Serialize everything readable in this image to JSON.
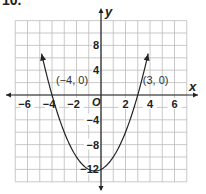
{
  "problem_label": "10.",
  "chart_data": {
    "type": "line",
    "title": "",
    "function": "y = x^2 + x - 12",
    "xlabel": "x",
    "ylabel": "y",
    "origin_label": "O",
    "xlim": [
      -7,
      7
    ],
    "ylim": [
      -14,
      12
    ],
    "x_ticks": [
      -6,
      -4,
      -2,
      2,
      4,
      6
    ],
    "y_ticks": [
      8,
      4,
      -4,
      -8,
      -12
    ],
    "x_grid_step": 1,
    "y_grid_step": 2,
    "grid": true,
    "annotations": [
      {
        "label": "(−4, 0)",
        "x": -4,
        "y": 0
      },
      {
        "label": "(3, 0)",
        "x": 3,
        "y": 0
      }
    ],
    "series": [
      {
        "name": "parabola",
        "x": [
          -4.8,
          -4.5,
          -4,
          -3,
          -2,
          -1,
          -0.5,
          0,
          1,
          2,
          3,
          3.5,
          3.8
        ],
        "y": [
          3.24,
          1.75,
          0,
          -6,
          -10,
          -12,
          -12.25,
          -12,
          -10,
          -6,
          0,
          3.75,
          6.24
        ]
      }
    ]
  }
}
